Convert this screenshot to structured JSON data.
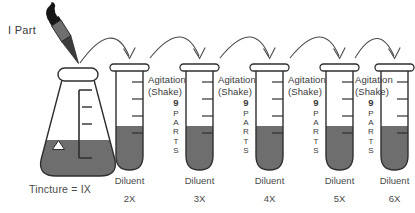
{
  "diagram": {
    "type": "serial-dilution-process",
    "title_text": "",
    "source": {
      "dropper_label": "I Part",
      "vessel_label": "Tincture = IX",
      "dropper_icon": "pipette-dropper-icon",
      "vessel_icon": "erlenmeyer-flask-icon"
    },
    "colors": {
      "liquid": "#6e6e6e",
      "outline": "#2f2f2f",
      "text": "#3a3a3a",
      "background": "#ffffff"
    },
    "arrow_label": "transfer-arrow",
    "steps": [
      {
        "parts_number": "9",
        "parts_word": "PARTS",
        "agitation_line1": "Agitation",
        "agitation_line2": "(Shake)",
        "diluent_label": "Diluent",
        "potency": "2X",
        "has_agitation": true
      },
      {
        "parts_number": "9",
        "parts_word": "PARTS",
        "agitation_line1": "Agitation",
        "agitation_line2": "(Shake)",
        "diluent_label": "Diluent",
        "potency": "3X",
        "has_agitation": true
      },
      {
        "parts_number": "9",
        "parts_word": "PARTS",
        "agitation_line1": "Agitation",
        "agitation_line2": "(Shake)",
        "diluent_label": "Diluent",
        "potency": "4X",
        "has_agitation": true
      },
      {
        "parts_number": "9",
        "parts_word": "PARTS",
        "agitation_line1": "Agitation",
        "agitation_line2": "(Shake)",
        "diluent_label": "Diluent",
        "potency": "5X",
        "has_agitation": true
      },
      {
        "parts_number": "9",
        "parts_word": "PARTS",
        "agitation_line1": "",
        "agitation_line2": "",
        "diluent_label": "Diluent",
        "potency": "6X",
        "has_agitation": false
      }
    ]
  }
}
